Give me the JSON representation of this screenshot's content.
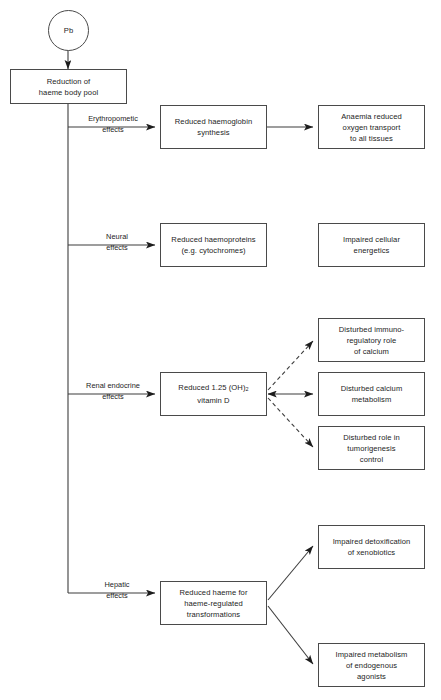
{
  "figure": {
    "caption_cutoff": "",
    "source_node": {
      "label": "Pb",
      "shape": "circle"
    },
    "root_node": {
      "label_line1": "Reduction of",
      "label_line2": "haeme body pool"
    }
  },
  "branches": [
    {
      "id": "erythropometic",
      "label_line1": "Erythropometic",
      "label_line2": "effects",
      "primary": {
        "line1": "Reduced haemoglobin",
        "line2": "synthesis"
      },
      "outcomes": [
        {
          "line1": "Anaemia reduced",
          "line2": "oxygen transport",
          "line3": "to all tissues",
          "connector": "solid-arrow"
        }
      ]
    },
    {
      "id": "neural",
      "label_line1": "Neural",
      "label_line2": "effects",
      "primary": {
        "line1": "Reduced haemoproteins",
        "line2": "(e.g. cytochromes)"
      },
      "outcomes": [
        {
          "line1": "Impaired cellular",
          "line2": "energetics",
          "line3": "",
          "connector": "none"
        }
      ]
    },
    {
      "id": "renal-endocrine",
      "label_line1": "Renal endocrine",
      "label_line2": "effects",
      "primary": {
        "line1": "Reduced 1.25 (OH)2",
        "line2": "vitamin D"
      },
      "outcomes": [
        {
          "line1": "Disturbed immuno-",
          "line2": "regulatory role",
          "line3": "of calcium",
          "connector": "dashed-arrow"
        },
        {
          "line1": "Disturbed calcium",
          "line2": "metabolism",
          "line3": "",
          "connector": "solid-double-arrow"
        },
        {
          "line1": "Disturbed role in",
          "line2": "tumorigenesis",
          "line3": "control",
          "connector": "dashed-arrow"
        }
      ]
    },
    {
      "id": "hepatic",
      "label_line1": "Hepatic",
      "label_line2": "effects",
      "primary": {
        "line1": "Reduced haeme for",
        "line2": "haeme-regulated",
        "line3": "transformations"
      },
      "outcomes": [
        {
          "line1": "Impaired detoxification",
          "line2": "of xenobiotics",
          "line3": "",
          "connector": "solid-arrow"
        },
        {
          "line1": "Impaired metabolism",
          "line2": "of endogenous",
          "line3": "agonists",
          "connector": "solid-arrow"
        }
      ]
    }
  ],
  "style": {
    "stroke": "#4a4a4a",
    "text": "#1d1d1d",
    "background": "#ffffff"
  }
}
